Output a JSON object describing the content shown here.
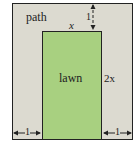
{
  "diagram": {
    "path_label": "path",
    "lawn_label": "lawn",
    "width_label": "x",
    "height_label": "2x",
    "top_gap_label": "1",
    "left_gap_label": "1",
    "right_gap_label": "1",
    "colors": {
      "path": "#dcdad0",
      "lawn": "#a8d080",
      "stroke": "#222222"
    }
  }
}
